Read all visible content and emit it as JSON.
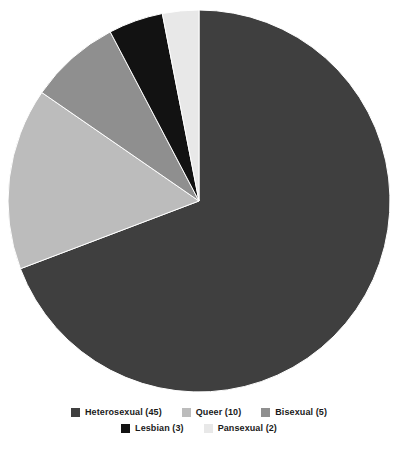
{
  "chart_data": {
    "type": "pie",
    "title": "",
    "subtitle": "",
    "xlabel": "",
    "ylabel": "",
    "total": 65,
    "start_angle": 0,
    "direction": "clockwise",
    "legend_position": "bottom",
    "grid": false,
    "background_color": "#ffffff",
    "categories": [
      "Heterosexual",
      "Queer",
      "Bisexual",
      "Lesbian",
      "Pansexual"
    ],
    "values": [
      45,
      10,
      5,
      3,
      2
    ],
    "colors": [
      "#3f3f3f",
      "#bcbcbc",
      "#8f8f8f",
      "#121212",
      "#e8e8e8"
    ],
    "slices": [
      {
        "label": "Heterosexual",
        "value": 45,
        "color": "#3f3f3f",
        "percent": 69.2,
        "angle_deg": 249.2
      },
      {
        "label": "Queer",
        "value": 10,
        "color": "#bcbcbc",
        "percent": 15.4,
        "angle_deg": 55.4
      },
      {
        "label": "Bisexual",
        "value": 5,
        "color": "#8f8f8f",
        "percent": 7.7,
        "angle_deg": 27.7
      },
      {
        "label": "Lesbian",
        "value": 3,
        "color": "#121212",
        "percent": 4.6,
        "angle_deg": 16.6
      },
      {
        "label": "Pansexual",
        "value": 2,
        "color": "#e8e8e8",
        "percent": 3.1,
        "angle_deg": 11.1
      }
    ]
  },
  "legend": {
    "rows": [
      {
        "items": [
          {
            "label": "Heterosexual (45)",
            "color": "#3f3f3f",
            "swatch_name": "legend-swatch-heterosexual"
          },
          {
            "label": "Queer (10)",
            "color": "#bcbcbc",
            "swatch_name": "legend-swatch-queer"
          },
          {
            "label": "Bisexual (5)",
            "color": "#8f8f8f",
            "swatch_name": "legend-swatch-bisexual"
          }
        ]
      },
      {
        "items": [
          {
            "label": "Lesbian (3)",
            "color": "#121212",
            "swatch_name": "legend-swatch-lesbian"
          },
          {
            "label": "Pansexual (2)",
            "color": "#e8e8e8",
            "swatch_name": "legend-swatch-pansexual"
          }
        ]
      }
    ]
  },
  "pie_geometry": {
    "center_x": 199,
    "center_y": 201,
    "radius": 191
  }
}
